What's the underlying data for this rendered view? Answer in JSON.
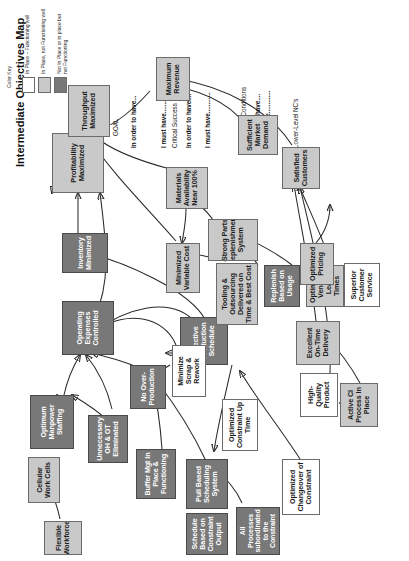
{
  "diagram": {
    "title": "Intermediate Objectives Map",
    "type": "intermediate-objectives-map"
  },
  "color_key": {
    "heading": "Color Key",
    "entries": [
      {
        "label": "In Place – Functioning well",
        "color": "#ffffff",
        "swatch_name": "swatch-white"
      },
      {
        "label": "In Place, not Functioning well",
        "color": "#c9c9c9",
        "swatch_name": "swatch-light-gray"
      },
      {
        "label": "Not In Place or in place but not Functioning",
        "color": "#787878",
        "swatch_name": "swatch-dark-gray"
      }
    ]
  },
  "hierarchy_labels": [
    {
      "text": "GOAL",
      "bold": false
    },
    {
      "text": "In order to have...",
      "bold": true
    },
    {
      "text": "I must have.............",
      "bold": true
    },
    {
      "text": "Critical Success Factors",
      "bold": false
    },
    {
      "text": "In order to have....",
      "bold": true
    },
    {
      "text": "I must have............",
      "bold": true
    },
    {
      "text": "Necessary Conditions",
      "bold": false
    },
    {
      "text": "In order to have....",
      "bold": true
    },
    {
      "text": "I must have.............",
      "bold": true
    },
    {
      "text": "Lower-Level NC's",
      "bold": false
    }
  ],
  "nodes": [
    {
      "id": "profitability",
      "label": "Profitability Maximized",
      "shade": "light"
    },
    {
      "id": "throughput",
      "label": "Throughput Maximized",
      "shade": "light"
    },
    {
      "id": "opex",
      "label": "Operating Expenses Controlled",
      "shade": "dark"
    },
    {
      "id": "inventory",
      "label": "Inventory Minimized",
      "shade": "dark"
    },
    {
      "id": "optimum_manpower",
      "label": "Optimum Manpower Staffing",
      "shade": "dark"
    },
    {
      "id": "cellular",
      "label": "Cellular Work Cells",
      "shade": "light"
    },
    {
      "id": "flexible",
      "label": "Flexible Workforce",
      "shade": "light"
    },
    {
      "id": "unnecessary_oh",
      "label": "Unnecessary OH & OT Eliminated",
      "shade": "dark"
    },
    {
      "id": "no_over",
      "label": "No Over-Production",
      "shade": "dark"
    },
    {
      "id": "buffer_mgt",
      "label": "Buffer Mgt In Place & Functioning",
      "shade": "dark"
    },
    {
      "id": "pull_based",
      "label": "Pull Based Scheduling System",
      "shade": "dark"
    },
    {
      "id": "schedule_based",
      "label": "Schedule Based on Constraint Output",
      "shade": "dark"
    },
    {
      "id": "all_processes",
      "label": "All Processes subordinated to the Constraint",
      "shade": "dark"
    },
    {
      "id": "eff_prod_sched",
      "label": "Effective Production Schedule",
      "shade": "dark"
    },
    {
      "id": "min_scrap",
      "label": "Minimize Scrap & Rework",
      "shade": "white"
    },
    {
      "id": "opt_constraint",
      "label": "Optimized Constraint Up Time",
      "shade": "white"
    },
    {
      "id": "opt_changeover",
      "label": "Optimized Changeover of Constraint",
      "shade": "white"
    },
    {
      "id": "min_variable",
      "label": "Minimized Variable Cost",
      "shade": "light"
    },
    {
      "id": "tooling",
      "label": "Tooling & Outsourcing Delivered on Time & Best Cost",
      "shade": "light"
    },
    {
      "id": "materials_avail",
      "label": "Materials Availability Near 100%",
      "shade": "light"
    },
    {
      "id": "strong_parts",
      "label": "Strong Parts Replenishment System",
      "shade": "light"
    },
    {
      "id": "replenish",
      "label": "Replenish Based on Usage",
      "shade": "dark"
    },
    {
      "id": "opt_vendor",
      "label": "Optimized Vendor Lead Times",
      "shade": "light"
    },
    {
      "id": "opt_pricing",
      "label": "Optimized Pricing",
      "shade": "light"
    },
    {
      "id": "max_revenue",
      "label": "Maximum Revenue",
      "shade": "light"
    },
    {
      "id": "suff_market",
      "label": "Sufficient Market Demand",
      "shade": "light"
    },
    {
      "id": "superior_cs",
      "label": "Superior Customer Service",
      "shade": "white"
    },
    {
      "id": "satisfied_cust",
      "label": "Satisfied Customers",
      "shade": "light"
    },
    {
      "id": "excellent_otd",
      "label": "Excellent On-Time Delivery",
      "shade": "light"
    },
    {
      "id": "active_ci",
      "label": "Active CI Process In Place",
      "shade": "light"
    },
    {
      "id": "high_quality",
      "label": "High-Quality Product",
      "shade": "white"
    }
  ]
}
